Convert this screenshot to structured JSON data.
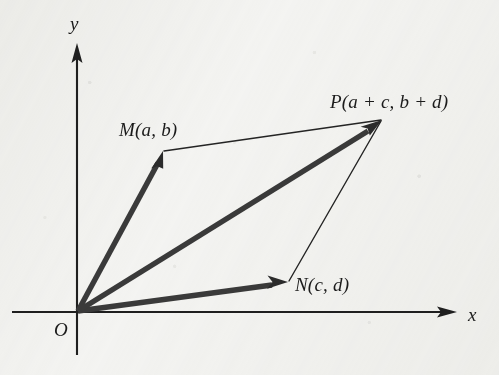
{
  "figure": {
    "background_color": "#f4f4f2",
    "ink_color": "#1b1b1b",
    "vector_color": "#2e2e2e"
  },
  "axes": {
    "x_label": "x",
    "y_label": "y",
    "origin_label": "O",
    "x_axis": {
      "x1": 12,
      "y1": 312,
      "x2": 455,
      "y2": 312,
      "arrow": "right"
    },
    "y_axis": {
      "x1": 77,
      "y1": 355,
      "x2": 77,
      "y2": 45,
      "arrow": "up"
    },
    "x_label_pos": {
      "x": 468,
      "y": 322
    },
    "y_label_pos": {
      "x": 70,
      "y": 32
    },
    "origin_label_pos": {
      "x": 54,
      "y": 338
    }
  },
  "points": {
    "O": {
      "label": "O",
      "x": 77,
      "y": 312
    },
    "M": {
      "label": "M(a, b)",
      "x": 163,
      "y": 152,
      "label_pos": {
        "x": 119,
        "y": 138
      }
    },
    "N": {
      "label": "N(c, d)",
      "x": 288,
      "y": 282,
      "label_pos": {
        "x": 295,
        "y": 292
      }
    },
    "P": {
      "label": "P(a + c, b + d)",
      "x": 382,
      "y": 120,
      "label_pos": {
        "x": 330,
        "y": 110
      }
    }
  },
  "vectors": [
    {
      "name": "OM",
      "from": "O",
      "to": "M",
      "style": "thick",
      "arrow": true
    },
    {
      "name": "ON",
      "from": "O",
      "to": "N",
      "style": "thick",
      "arrow": true
    },
    {
      "name": "OP",
      "from": "O",
      "to": "P",
      "style": "thick",
      "arrow": true
    }
  ],
  "construction_lines": [
    {
      "name": "MP",
      "from": "M",
      "to": "P",
      "style": "thin",
      "arrow": false
    },
    {
      "name": "NP",
      "from": "N",
      "to": "P",
      "style": "thin",
      "arrow": false
    }
  ]
}
